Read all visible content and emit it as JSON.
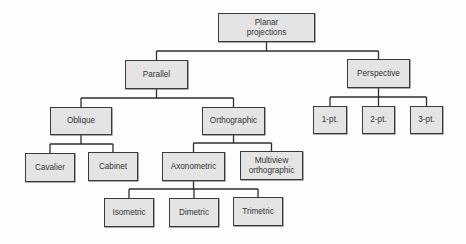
{
  "diagram": {
    "nodes": [
      {
        "id": "planar",
        "label": "Planar\nprojections",
        "x": 218,
        "y": 13,
        "w": 97,
        "h": 29
      },
      {
        "id": "parallel",
        "label": "Parallel",
        "x": 125,
        "y": 60,
        "w": 63,
        "h": 29
      },
      {
        "id": "perspective",
        "label": "Perspective",
        "x": 347,
        "y": 59,
        "w": 63,
        "h": 29
      },
      {
        "id": "oblique",
        "label": "Oblique",
        "x": 50,
        "y": 107,
        "w": 62,
        "h": 28
      },
      {
        "id": "orthographic",
        "label": "Orthographic",
        "x": 202,
        "y": 107,
        "w": 63,
        "h": 28
      },
      {
        "id": "onept",
        "label": "1-pt.",
        "x": 313,
        "y": 106,
        "w": 34,
        "h": 28
      },
      {
        "id": "twopt",
        "label": "2-pt.",
        "x": 362,
        "y": 106,
        "w": 33,
        "h": 28
      },
      {
        "id": "threept",
        "label": "3-pt.",
        "x": 410,
        "y": 106,
        "w": 33,
        "h": 28
      },
      {
        "id": "cavalier",
        "label": "Cavalier",
        "x": 25,
        "y": 153,
        "w": 50,
        "h": 29
      },
      {
        "id": "cabinet",
        "label": "Cabinet",
        "x": 88,
        "y": 152,
        "w": 50,
        "h": 29
      },
      {
        "id": "axonometric",
        "label": "Axonometric",
        "x": 162,
        "y": 152,
        "w": 63,
        "h": 29
      },
      {
        "id": "multiview",
        "label": "Multiview\northographic",
        "x": 240,
        "y": 151,
        "w": 63,
        "h": 29
      },
      {
        "id": "isometric",
        "label": "Isometric",
        "x": 104,
        "y": 198,
        "w": 50,
        "h": 29
      },
      {
        "id": "dimetric",
        "label": "Dimetric",
        "x": 169,
        "y": 198,
        "w": 50,
        "h": 29
      },
      {
        "id": "trimetric",
        "label": "Trimetric",
        "x": 233,
        "y": 197,
        "w": 50,
        "h": 29
      }
    ],
    "edges": [
      [
        "planar",
        "parallel"
      ],
      [
        "planar",
        "perspective"
      ],
      [
        "parallel",
        "oblique"
      ],
      [
        "parallel",
        "orthographic"
      ],
      [
        "perspective",
        "onept"
      ],
      [
        "perspective",
        "twopt"
      ],
      [
        "perspective",
        "threept"
      ],
      [
        "oblique",
        "cavalier"
      ],
      [
        "oblique",
        "cabinet"
      ],
      [
        "orthographic",
        "axonometric"
      ],
      [
        "orthographic",
        "multiview"
      ],
      [
        "axonometric",
        "isometric"
      ],
      [
        "axonometric",
        "dimetric"
      ],
      [
        "axonometric",
        "trimetric"
      ]
    ]
  }
}
